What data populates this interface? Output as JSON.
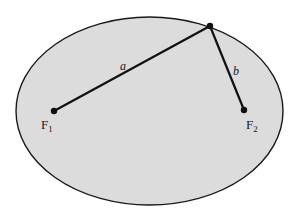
{
  "diagram": {
    "type": "ellipse-foci",
    "colors": {
      "fill": "#dcdcdc",
      "stroke": "#1a1a1a",
      "background": "#ffffff"
    },
    "ellipse": {
      "cx": 149.5,
      "cy": 111,
      "rx": 133.5,
      "ry": 94
    },
    "points": {
      "focus1": {
        "x": 54,
        "y": 111,
        "label": "F",
        "subscript": "1"
      },
      "focus2": {
        "x": 244,
        "y": 110,
        "label": "F",
        "subscript": "2"
      },
      "point_on_ellipse": {
        "x": 210,
        "y": 26
      }
    },
    "segments": [
      {
        "label": "a",
        "from": "focus1",
        "to": "point_on_ellipse"
      },
      {
        "label": "b",
        "from": "point_on_ellipse",
        "to": "focus2"
      }
    ]
  }
}
